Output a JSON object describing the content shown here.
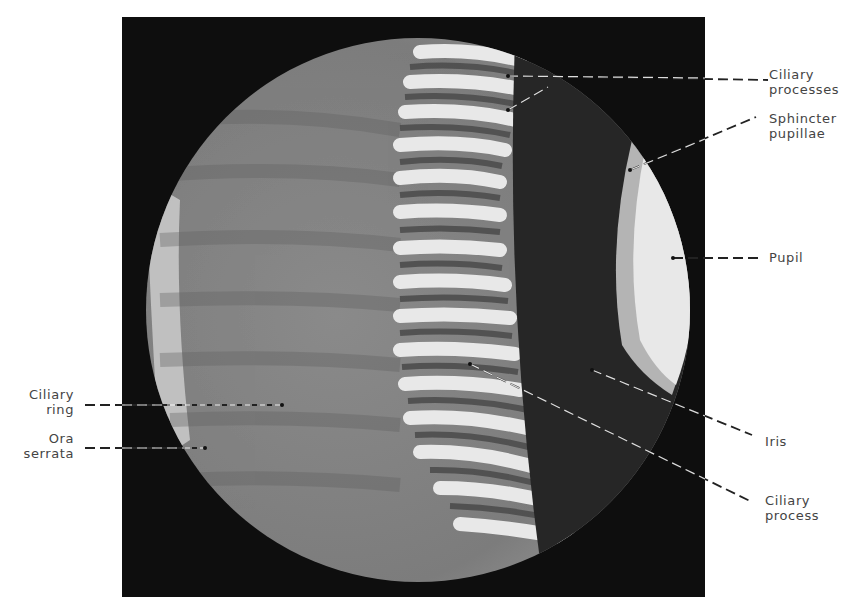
{
  "figure": {
    "labels": {
      "ciliary_processes": [
        "Ciliary",
        "processes"
      ],
      "sphincter_pupillae": [
        "Sphincter",
        "pupillae"
      ],
      "pupil": [
        "Pupil"
      ],
      "iris": [
        "Iris"
      ],
      "ciliary_process": [
        "Ciliary",
        "process"
      ],
      "ciliary_ring": [
        "Ciliary",
        "ring"
      ],
      "ora_serrata": [
        "Ora",
        "serrata"
      ]
    },
    "colors": {
      "background": "#ffffff",
      "frame": "#0e0e0e",
      "tissue": "#8c8c8c",
      "iris": "#2a2a2a",
      "pupil": "#e6e6e6",
      "leader_line": "#222222"
    }
  }
}
